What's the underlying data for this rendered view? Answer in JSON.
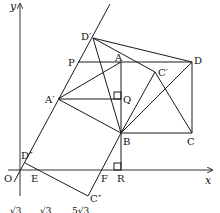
{
  "diagram": {
    "type": "coordinate-geometry",
    "axes": {
      "x_label": "x",
      "y_label": "y",
      "origin_label": "O"
    },
    "points": {
      "D_prime": "D′",
      "P": "P",
      "A": "A",
      "D": "D",
      "C_prime": "C′",
      "A_prime": "A′",
      "Q": "Q",
      "B": "B",
      "C": "C",
      "D_dprime": "D″",
      "E": "E",
      "F": "F",
      "R": "R",
      "C_dprime": "C″"
    },
    "bottom_text": [
      "√3",
      "√3",
      "5√3"
    ]
  }
}
